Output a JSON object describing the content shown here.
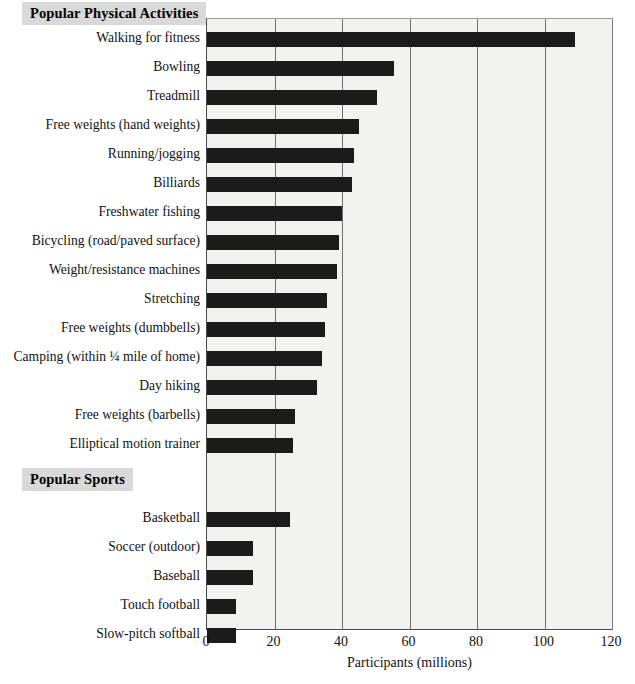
{
  "chart_data": {
    "type": "bar",
    "orientation": "horizontal",
    "title": "",
    "xlabel": "Participants (millions)",
    "ylabel": "",
    "xlim": [
      0,
      120
    ],
    "xticks": [
      "0",
      "20",
      "40",
      "60",
      "80",
      "100",
      "120"
    ],
    "grid": "vertical",
    "legend": "none",
    "bar_color": "#1b1b1b",
    "plot_background": "#f2f2f1",
    "gridline_color": "#6f6f6f",
    "header_background": "#d9d9d9",
    "groups": [
      {
        "header": "Popular Physical Activities",
        "categories": [
          "Walking for fitness",
          "Bowling",
          "Treadmill",
          "Free weights (hand weights)",
          "Running/jogging",
          "Billiards",
          "Freshwater fishing",
          "Bicycling (road/paved surface)",
          "Weight/resistance machines",
          "Stretching",
          "Free weights (dumbbells)",
          "Camping (within ¼ mile of home)",
          "Day hiking",
          "Free weights (barbells)",
          "Elliptical motion trainer"
        ],
        "values": [
          109,
          55.5,
          50.5,
          45,
          43.5,
          43,
          40,
          39,
          38.5,
          35.5,
          35,
          34,
          32.5,
          26,
          25.5
        ]
      },
      {
        "header": "Popular Sports",
        "categories": [
          "Basketball",
          "Soccer (outdoor)",
          "Baseball",
          "Touch football",
          "Slow-pitch softball"
        ],
        "values": [
          24.5,
          13.5,
          13.5,
          8.5,
          8.5
        ]
      }
    ]
  },
  "headers": {
    "activities": "Popular Physical Activities",
    "sports": "Popular Sports"
  },
  "axis": {
    "x_title": "Participants (millions)"
  }
}
